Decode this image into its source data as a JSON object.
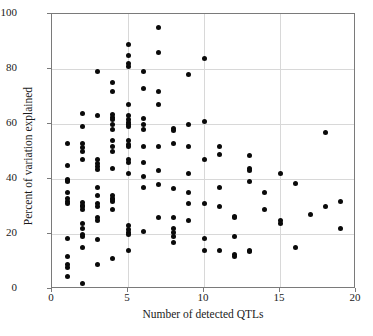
{
  "figure": {
    "width": 373,
    "height": 336,
    "background": "#ffffff",
    "point_color": "#0a0a0a",
    "frame_color": "#7a7a7a",
    "grid_color": "#d8d8d8"
  },
  "chart_data": {
    "type": "scatter",
    "title": "",
    "xlabel": "Number of detected QTLs",
    "ylabel": "Percent of variation explained",
    "xlim": [
      0,
      20
    ],
    "ylim": [
      0,
      100
    ],
    "xticks": [
      0,
      5,
      10,
      15,
      20
    ],
    "yticks": [
      0,
      20,
      40,
      60,
      80,
      100
    ],
    "xtick_labels": [
      "0",
      "5",
      "10",
      "15",
      "20"
    ],
    "ytick_labels": [
      "0",
      "20",
      "40",
      "60",
      "80",
      "100"
    ],
    "grid": true,
    "grid_axis": "both",
    "legend": null,
    "marker": "filled-circle",
    "marker_size": 5,
    "series": [
      {
        "name": "QTL studies",
        "points": [
          [
            1,
            53
          ],
          [
            1,
            45
          ],
          [
            1,
            40
          ],
          [
            1,
            39.5
          ],
          [
            1,
            39
          ],
          [
            1,
            35
          ],
          [
            1,
            33
          ],
          [
            1,
            32
          ],
          [
            1,
            31
          ],
          [
            1,
            18.5
          ],
          [
            1,
            12
          ],
          [
            1,
            9
          ],
          [
            1,
            8
          ],
          [
            1,
            4.5
          ],
          [
            2,
            64
          ],
          [
            2,
            59
          ],
          [
            2,
            53
          ],
          [
            2,
            51.5
          ],
          [
            2,
            50
          ],
          [
            2,
            47
          ],
          [
            2,
            31.5
          ],
          [
            2,
            30.5
          ],
          [
            2,
            30
          ],
          [
            2,
            29
          ],
          [
            2,
            24
          ],
          [
            2,
            22
          ],
          [
            2,
            20
          ],
          [
            2,
            19
          ],
          [
            2,
            15
          ],
          [
            2,
            2
          ],
          [
            3,
            79
          ],
          [
            3,
            63
          ],
          [
            3,
            47
          ],
          [
            3,
            45.5
          ],
          [
            3,
            44.5
          ],
          [
            3,
            43.5
          ],
          [
            3,
            37
          ],
          [
            3,
            34
          ],
          [
            3,
            31
          ],
          [
            3,
            30
          ],
          [
            3,
            26
          ],
          [
            3,
            25
          ],
          [
            3,
            18
          ],
          [
            3,
            9
          ],
          [
            4,
            75
          ],
          [
            4,
            72
          ],
          [
            4,
            63.5
          ],
          [
            4,
            62.5
          ],
          [
            4,
            61.5
          ],
          [
            4,
            60
          ],
          [
            4,
            58
          ],
          [
            4,
            54
          ],
          [
            4,
            52
          ],
          [
            4,
            50
          ],
          [
            4,
            44
          ],
          [
            4,
            34
          ],
          [
            4,
            33
          ],
          [
            4,
            32.5
          ],
          [
            4,
            32
          ],
          [
            4,
            29
          ],
          [
            4,
            11
          ],
          [
            5,
            89
          ],
          [
            5,
            85
          ],
          [
            5,
            82
          ],
          [
            5,
            81
          ],
          [
            5,
            67
          ],
          [
            5,
            63
          ],
          [
            5,
            61.5
          ],
          [
            5,
            60.5
          ],
          [
            5,
            60
          ],
          [
            5,
            59
          ],
          [
            5,
            54
          ],
          [
            5,
            52.5
          ],
          [
            5,
            52
          ],
          [
            5,
            47
          ],
          [
            5,
            46
          ],
          [
            5,
            42
          ],
          [
            5,
            23
          ],
          [
            5,
            21.5
          ],
          [
            5,
            20.5
          ],
          [
            5,
            20
          ],
          [
            5,
            14
          ],
          [
            6,
            79
          ],
          [
            6,
            73
          ],
          [
            6,
            62
          ],
          [
            6,
            60
          ],
          [
            6,
            58
          ],
          [
            6,
            52
          ],
          [
            6,
            46
          ],
          [
            6,
            41
          ],
          [
            6,
            37
          ],
          [
            6,
            21
          ],
          [
            7,
            95
          ],
          [
            7,
            86
          ],
          [
            7,
            72
          ],
          [
            7,
            67
          ],
          [
            7,
            52
          ],
          [
            7,
            43
          ],
          [
            7,
            38
          ],
          [
            7,
            26
          ],
          [
            8,
            58.5
          ],
          [
            8,
            57.5
          ],
          [
            8,
            53
          ],
          [
            8,
            36.5
          ],
          [
            8,
            26
          ],
          [
            8,
            22
          ],
          [
            8,
            20.5
          ],
          [
            8,
            19
          ],
          [
            8,
            17
          ],
          [
            9,
            78
          ],
          [
            9,
            60
          ],
          [
            9,
            52
          ],
          [
            9,
            42
          ],
          [
            9,
            35
          ],
          [
            9,
            31
          ],
          [
            9,
            25
          ],
          [
            10,
            84
          ],
          [
            10,
            61
          ],
          [
            10,
            47
          ],
          [
            10,
            31
          ],
          [
            10,
            18.5
          ],
          [
            10,
            14
          ],
          [
            11,
            52
          ],
          [
            11,
            49
          ],
          [
            11,
            37
          ],
          [
            11,
            30
          ],
          [
            11,
            14
          ],
          [
            12,
            26.5
          ],
          [
            12,
            26
          ],
          [
            12,
            19
          ],
          [
            12,
            12.5
          ],
          [
            12,
            12
          ],
          [
            13,
            48.5
          ],
          [
            13,
            44
          ],
          [
            13,
            43
          ],
          [
            13,
            39
          ],
          [
            13,
            14
          ],
          [
            13,
            13.5
          ],
          [
            14,
            35
          ],
          [
            14,
            29
          ],
          [
            15,
            42
          ],
          [
            15,
            25
          ],
          [
            15,
            24
          ],
          [
            16,
            38.5
          ],
          [
            16,
            15
          ],
          [
            17,
            27
          ],
          [
            18,
            57
          ],
          [
            18,
            30
          ],
          [
            19,
            32
          ],
          [
            19,
            22
          ]
        ]
      }
    ]
  }
}
